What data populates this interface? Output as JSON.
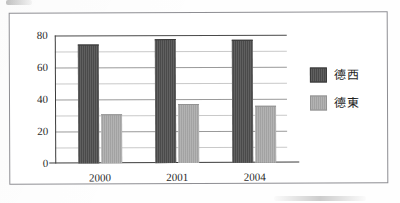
{
  "chart_data": {
    "type": "bar",
    "title": "",
    "subtitle": "",
    "xlabel": "",
    "ylabel": "",
    "categories": [
      "2000",
      "2001",
      "2004"
    ],
    "series": [
      {
        "name": "德西",
        "values": [
          74,
          77,
          76
        ],
        "color": "#4e4e4e"
      },
      {
        "name": "德東",
        "values": [
          30,
          36,
          35
        ],
        "color": "#a9a9a9"
      }
    ],
    "ylim": [
      0,
      80
    ],
    "ytick_labels": [
      "0",
      "20",
      "40",
      "60",
      "80"
    ],
    "ytick_values": [
      0,
      20,
      40,
      60,
      80
    ],
    "minor_gridline_values": [
      10,
      30,
      50,
      70
    ],
    "grid": true,
    "grid_orientation": "horizontal",
    "legend_position": "right",
    "annotations": []
  },
  "legend": {
    "items": [
      {
        "label": "德西",
        "swatch": "dark-grey-swatch"
      },
      {
        "label": "德東",
        "swatch": "light-grey-swatch"
      }
    ]
  },
  "colors": {
    "series_west": "#4e4e4e",
    "series_east": "#a9a9a9",
    "axis": "#3c3c3c",
    "gridline": "#c9c9c9",
    "frame_border": "#8e8e93",
    "text": "#2b2b2b",
    "background": "#ffffff"
  }
}
